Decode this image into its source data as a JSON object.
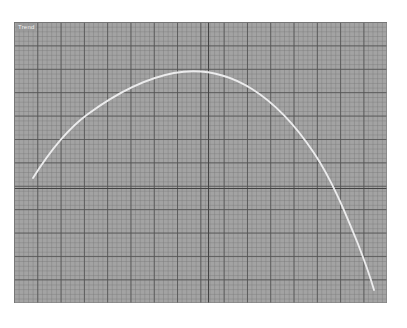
{
  "canvas": {
    "width": 407,
    "height": 328,
    "background": "#ffffff"
  },
  "plot": {
    "label": "Trend",
    "surface_color": "#a3a3a3",
    "minor_grid_color": "#787878",
    "major_grid_color": "#525252",
    "axis_color": "#434343",
    "curve_color": "#ececed",
    "bounds": {
      "left": 14,
      "top": 22,
      "width": 373,
      "height": 281
    },
    "origin": {
      "x": 208,
      "y": 188
    },
    "minor_grid_px": 4.7,
    "major_grid_px": 23.3
  },
  "chart_data": {
    "type": "line",
    "title": "Trend",
    "xlabel": "",
    "ylabel": "",
    "grid": true,
    "legend": "none",
    "series": [
      {
        "name": "Trend",
        "color": "#ececed",
        "points": [
          {
            "x": 0.05,
            "y": 0.3
          },
          {
            "x": 0.1,
            "y": 0.45
          },
          {
            "x": 0.15,
            "y": 0.57
          },
          {
            "x": 0.2,
            "y": 0.66
          },
          {
            "x": 0.25,
            "y": 0.74
          },
          {
            "x": 0.3,
            "y": 0.81
          },
          {
            "x": 0.35,
            "y": 0.87
          },
          {
            "x": 0.4,
            "y": 0.92
          },
          {
            "x": 0.45,
            "y": 0.96
          },
          {
            "x": 0.5,
            "y": 0.98
          },
          {
            "x": 0.55,
            "y": 0.97
          },
          {
            "x": 0.6,
            "y": 0.94
          },
          {
            "x": 0.65,
            "y": 0.88
          },
          {
            "x": 0.7,
            "y": 0.8
          },
          {
            "x": 0.75,
            "y": 0.69
          },
          {
            "x": 0.8,
            "y": 0.56
          },
          {
            "x": 0.85,
            "y": 0.41
          },
          {
            "x": 0.9,
            "y": 0.24
          },
          {
            "x": 0.93,
            "y": 0.12
          }
        ]
      }
    ],
    "xlim": [
      0,
      1
    ],
    "ylim": [
      0,
      1
    ],
    "curve_path": "M 19 156 C 34 132, 52 108, 74 92 C 100 73, 128 57, 160 51 C 188 46, 214 52, 238 67 C 262 82, 282 104, 300 131 C 318 158, 331 190, 344 222 C 351 240, 356 254, 360 268"
  }
}
